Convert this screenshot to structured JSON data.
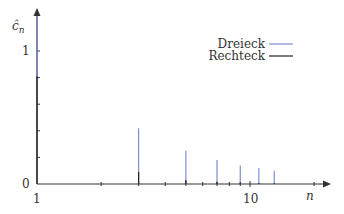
{
  "chart_data": {
    "type": "bar",
    "title": "",
    "xlabel": "n",
    "ylabel": "ĉn",
    "x_scale": "log",
    "xlim": [
      1,
      25
    ],
    "ylim": [
      0,
      1.3
    ],
    "x_tick_labels": [
      "1",
      "10"
    ],
    "y_tick_labels": [
      "0",
      "1"
    ],
    "x_minor_ticks": [
      2,
      3,
      4,
      5,
      6,
      7,
      8,
      9,
      20
    ],
    "y_minor_ticks": [
      0.2,
      0.4,
      0.6,
      0.8
    ],
    "grid": false,
    "legend_position": "upper right",
    "categories": [
      1,
      3,
      5,
      7,
      9,
      11,
      13
    ],
    "series": [
      {
        "name": "Dreieck",
        "color": "#7f8fd0",
        "values": [
          1.27,
          0.42,
          0.25,
          0.18,
          0.14,
          0.12,
          0.1
        ]
      },
      {
        "name": "Rechteck",
        "color": "#222222",
        "values": [
          0.81,
          0.09,
          0.03,
          0.017,
          0.01,
          0.007,
          0.005
        ]
      }
    ]
  },
  "labels": {
    "y_axis": "ĉ",
    "y_axis_sub": "n",
    "x_axis": "n",
    "y_tick_1": "1",
    "y_tick_0": "0",
    "x_tick_1": "1",
    "x_tick_10": "10",
    "legend_1": "Dreieck",
    "legend_2": "Rechteck"
  }
}
